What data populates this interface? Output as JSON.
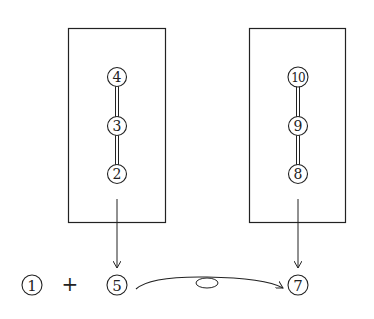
{
  "diagram": {
    "left_box": {
      "nodes": [
        {
          "id": "node-4",
          "label": "4",
          "cx": 117,
          "cy": 77
        },
        {
          "id": "node-3",
          "label": "3",
          "cx": 117,
          "cy": 126
        },
        {
          "id": "node-2",
          "label": "2",
          "cx": 117,
          "cy": 174
        }
      ]
    },
    "right_box": {
      "nodes": [
        {
          "id": "node-10",
          "label": "10",
          "cx": 298,
          "cy": 77
        },
        {
          "id": "node-9",
          "label": "9",
          "cx": 298,
          "cy": 126
        },
        {
          "id": "node-8",
          "label": "8",
          "cx": 298,
          "cy": 174
        }
      ]
    },
    "bottom_row": {
      "node_1": "1",
      "plus": "+",
      "node_5": "5",
      "node_7": "7"
    },
    "colors": {
      "stroke": "#222222",
      "background": "#ffffff"
    }
  }
}
